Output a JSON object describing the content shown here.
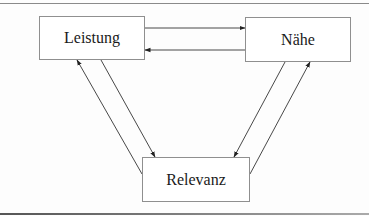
{
  "diagram": {
    "type": "cycle-with-bidirectional-arrows",
    "nodes": [
      {
        "id": "leistung",
        "label": "Leistung"
      },
      {
        "id": "naehe",
        "label": "Nähe"
      },
      {
        "id": "relevanz",
        "label": "Relevanz"
      }
    ],
    "edges": [
      {
        "from": "leistung",
        "to": "naehe"
      },
      {
        "from": "naehe",
        "to": "leistung"
      },
      {
        "from": "leistung",
        "to": "relevanz"
      },
      {
        "from": "relevanz",
        "to": "leistung"
      },
      {
        "from": "naehe",
        "to": "relevanz"
      },
      {
        "from": "relevanz",
        "to": "naehe"
      }
    ],
    "colors": {
      "line": "#333333",
      "box_border": "#8f8f8f",
      "text": "#1a1a1a"
    }
  }
}
